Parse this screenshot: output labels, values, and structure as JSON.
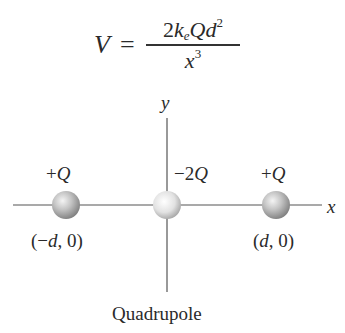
{
  "equation": {
    "lhs": "V",
    "equals": "=",
    "numerator": {
      "coefficient": "2",
      "k": "k",
      "k_subscript": "e",
      "charge": "Q",
      "distance": "d",
      "distance_exponent": "2"
    },
    "denominator": {
      "variable": "x",
      "exponent": "3"
    }
  },
  "axes": {
    "x_label": "x",
    "y_label": "y",
    "color": "#555555"
  },
  "charges": [
    {
      "label": "+Q",
      "coordinate": "(−d, 0)",
      "x": 66,
      "y": 205
    },
    {
      "label": "−2Q",
      "coordinate": "",
      "x": 167,
      "y": 205
    },
    {
      "label": "+Q",
      "coordinate": "(d, 0)",
      "x": 276,
      "y": 205
    }
  ],
  "caption": "Quadrupole",
  "colors": {
    "sphere_light": "#f2f2f2",
    "sphere_mid": "#b8b8b8",
    "sphere_dark": "#7a7a7a",
    "center_sphere_light": "#ffffff",
    "center_sphere_dark": "#9a9a9a",
    "text": "#2a2a2a"
  }
}
